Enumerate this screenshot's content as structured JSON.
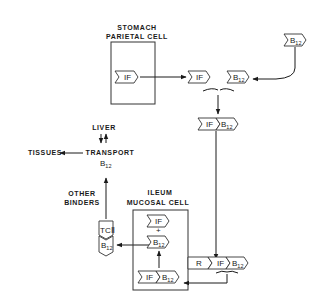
{
  "diagram": {
    "type": "flow",
    "compartments": {
      "stomach": {
        "line1": "STOMACH",
        "line2": "PARIETAL CELL"
      },
      "ileum": {
        "line1": "ILEUM",
        "line2": "MUCOSAL CELL"
      }
    },
    "molecules": {
      "if": "IF",
      "b": "B",
      "sub12": "12",
      "r": "R",
      "tc": "TCⅡ"
    },
    "labels": {
      "liver": "LIVER",
      "tissues": "TISSUES",
      "transport": "TRANSPORT",
      "transport_b": "B",
      "transport_sub": "12",
      "other1": "OTHER",
      "other2": "BINDERS",
      "plus": "+"
    }
  }
}
